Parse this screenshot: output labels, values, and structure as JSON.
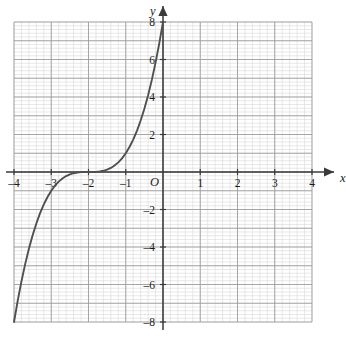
{
  "chart_data": {
    "type": "line",
    "title": "",
    "subtitle": "",
    "xlabel": "x",
    "ylabel": "y",
    "origin_label": "O",
    "xlim": [
      -4,
      4
    ],
    "ylim": [
      -8,
      8
    ],
    "grid": true,
    "grid_major_step_x": 1,
    "grid_major_step_y": 2,
    "grid_minor_subdivisions": 5,
    "legend": "none",
    "x_tick_labels": [
      "-4",
      "-3",
      "-2",
      "-1",
      "1",
      "2",
      "3",
      "4"
    ],
    "x_tick_values": [
      -4,
      -3,
      -2,
      -1,
      1,
      2,
      3,
      4
    ],
    "y_tick_labels": [
      "8",
      "6",
      "4",
      "2",
      "-2",
      "-4",
      "-6",
      "-8"
    ],
    "y_tick_values": [
      8,
      6,
      4,
      2,
      -2,
      -4,
      -6,
      -8
    ],
    "series": [
      {
        "name": "y = (x + 2)^3",
        "equation": "y = (x + 2)^3",
        "color": "#4f4f4f",
        "x": [
          -4.0,
          -3.9,
          -3.8,
          -3.7,
          -3.6,
          -3.5,
          -3.4,
          -3.3,
          -3.2,
          -3.1,
          -3.0,
          -2.9,
          -2.8,
          -2.7,
          -2.6,
          -2.5,
          -2.4,
          -2.3,
          -2.2,
          -2.1,
          -2.0,
          -1.9,
          -1.8,
          -1.7,
          -1.6,
          -1.5,
          -1.4,
          -1.3,
          -1.2,
          -1.1,
          -1.0,
          -0.9,
          -0.8,
          -0.7,
          -0.6,
          -0.5,
          -0.4,
          -0.3,
          -0.2,
          -0.1,
          0.0
        ],
        "y": [
          -8.0,
          -6.859,
          -5.832,
          -4.913,
          -4.096,
          -3.375,
          -2.744,
          -2.197,
          -1.728,
          -1.331,
          -1.0,
          -0.729,
          -0.512,
          -0.343,
          -0.216,
          -0.125,
          -0.064,
          -0.027,
          -0.008,
          -0.001,
          0.0,
          0.001,
          0.008,
          0.027,
          0.064,
          0.125,
          0.216,
          0.343,
          0.512,
          0.729,
          1.0,
          1.331,
          1.728,
          2.197,
          2.744,
          3.375,
          4.096,
          4.913,
          5.832,
          6.859,
          8.0
        ],
        "key_points": [
          {
            "x": -4,
            "y": -8
          },
          {
            "x": -3,
            "y": -1
          },
          {
            "x": -2,
            "y": 0
          },
          {
            "x": -1,
            "y": 1
          },
          {
            "x": 0,
            "y": 8
          }
        ],
        "inflection_point": {
          "x": -2,
          "y": 0
        }
      }
    ]
  },
  "colors": {
    "curve": "#4f4f4f",
    "axis": "#3a3a3a",
    "grid_major": "#9a9a9a",
    "grid_minor": "#d8d8d8",
    "text": "#1a1a1a",
    "background": "#ffffff"
  },
  "axes": {
    "x_name": "x",
    "y_name": "y",
    "origin": "O"
  }
}
